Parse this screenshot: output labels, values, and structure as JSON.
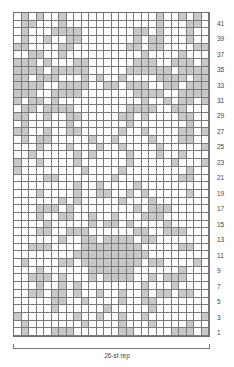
{
  "chart_data": {
    "type": "table",
    "title": "",
    "columns": 26,
    "rows": 42,
    "shaded_color": "#c9c9c9",
    "grid_color": "#7a7a7a",
    "row_labels": [
      "41",
      "39",
      "37",
      "35",
      "33",
      "31",
      "29",
      "27",
      "25",
      "23",
      "21",
      "19",
      "17",
      "15",
      "13",
      "11",
      "9",
      "7",
      "5",
      "3",
      "1"
    ],
    "row_label_side": "right",
    "footer_label": "26-st rep",
    "pattern_top_to_bottom": [
      ".#.#..#............#..#.#.",
      ".##...#............#...##.",
      ".#...####.......##.#...#..",
      ".#..#..##.......#.##...#..",
      "##....##.......##.##....##",
      "..##..#..........#....#...",
      "###.#...##......###..###.#",
      "####.#####.....######.####",
      "##.###...#.#..#....####.##",
      "####..####..##.###..##.###",
      "###..####.......####..####",
      "#.##.#...........#..#.##.#",
      ".##.####.......####..##...",
      "##..#..##.....##.#....##..",
      ".#.....#.......#.......#..",
      "##..#..##.....#..#....##.#",
      ".#.##.....#..#....#...##..",
      "...#...#...#..#....#.....#",
      "..#.....#.#....#...#..#...",
      "#..#....#......#.....#...#",
      "#........#....#........#..",
      "....##.......#........##..",
      "........#..#....#.........",
      "...#....#..##..#.#.....#..",
      "......#.#.....#...#.......",
      "...###.#........#.###.....",
      "...#..##..#..#...###......",
      "....#.....#.##.#....#.....",
      "...##..###......##..###...",
      "......#..##.####.##.......",
      "..###....########.....##..",
      "........##########........",
      ".#....##.########.##....#.",
      "...#......######......#...",
      "..###.#...#.####..#.###...",
      "...#..#.#........#...#....",
      "..##.##.#..#..#..#.##.##..",
      ".....##..#....#..##.......",
      ".....#......#.....#.......",
      "#.......#..#..#..#.......#",
      ".#.......#....#...#....#..",
      ".#...###......##.....###.#"
    ]
  }
}
